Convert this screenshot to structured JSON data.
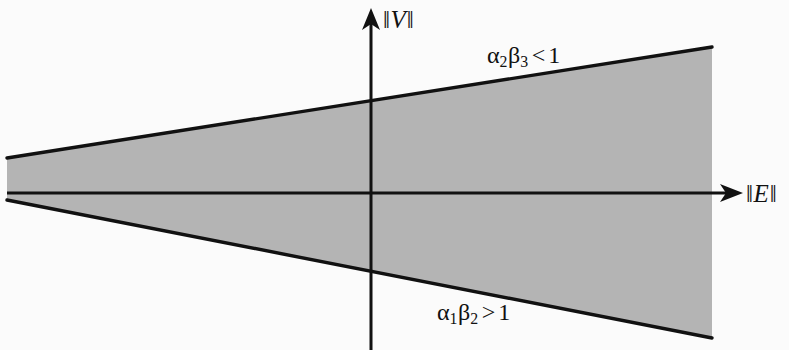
{
  "figure": {
    "background_color": "#fbfbfb",
    "fill_color": "#b4b4b4",
    "line_color": "#111111",
    "axes": {
      "y_axis": {
        "label": "||V||",
        "label_parts": {
          "bar_left": "‖",
          "symbol": "V",
          "bar_right": "‖"
        },
        "arrow": "up-arrow-icon"
      },
      "x_axis": {
        "label": "||E||",
        "label_parts": {
          "bar_left": "‖",
          "symbol": "E",
          "bar_right": "‖"
        },
        "arrow": "right-arrow-icon"
      }
    },
    "annotations": [
      {
        "name": "upper-condition",
        "text": "α₂β₃ < 1",
        "parts": {
          "alpha": "α",
          "alpha_sub": "2",
          "beta": "β",
          "beta_sub": "3",
          "relation": "<",
          "value": "1"
        }
      },
      {
        "name": "lower-condition",
        "text": "α₁β₂ > 1",
        "parts": {
          "alpha": "α",
          "alpha_sub": "1",
          "beta": "β",
          "beta_sub": "2",
          "relation": ">",
          "value": "1"
        }
      }
    ]
  },
  "chart_data": {
    "type": "line",
    "title": "",
    "xlabel": "||E||",
    "ylabel": "||V||",
    "grid": false,
    "legend": null,
    "origin_px": {
      "x": 371,
      "y": 193
    },
    "xlim_px": [
      0,
      789
    ],
    "ylim_px": [
      0,
      350
    ],
    "series": [
      {
        "name": "upper-boundary",
        "annotation": "α₂β₃ < 1",
        "points_px": [
          [
            7,
            158
          ],
          [
            371,
            104
          ],
          [
            712,
            47
          ]
        ]
      },
      {
        "name": "lower-boundary",
        "annotation": "α₁β₂ > 1",
        "points_px": [
          [
            7,
            200
          ],
          [
            371,
            272
          ],
          [
            712,
            338
          ]
        ]
      },
      {
        "name": "x-axis",
        "annotation": "||E||",
        "points_px": [
          [
            7,
            193
          ],
          [
            742,
            193
          ]
        ]
      },
      {
        "name": "y-axis",
        "annotation": "||V||",
        "points_px": [
          [
            371,
            9
          ],
          [
            371,
            350
          ]
        ]
      }
    ],
    "shaded_regions": [
      {
        "name": "cone-region",
        "fill": "#b4b4b4",
        "polygon_px": [
          [
            7,
            158
          ],
          [
            712,
            47
          ],
          [
            712,
            338
          ],
          [
            7,
            200
          ]
        ]
      }
    ]
  }
}
